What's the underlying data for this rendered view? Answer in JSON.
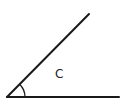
{
  "diagram": {
    "type": "angle",
    "label": "C",
    "colors": {
      "stroke": "#1a1a1a",
      "background": "#ffffff",
      "text": "#222222"
    },
    "vertex": [
      7,
      97
    ],
    "ray_horizontal_end": [
      119,
      97
    ],
    "ray_slanted_end": [
      89,
      14
    ],
    "arc_radius": 18
  }
}
